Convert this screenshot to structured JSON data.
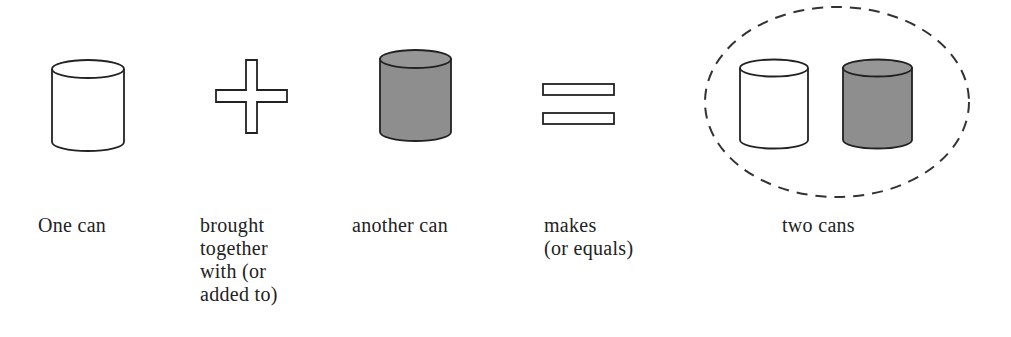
{
  "diagram": {
    "title": "",
    "colors": {
      "stroke": "#222222",
      "can_white": "#ffffff",
      "can_gray": "#8e8e8e",
      "dashed_ellipse": "#333333"
    },
    "items": [
      {
        "id": "one-can",
        "icon": "white-can",
        "label": "One can"
      },
      {
        "id": "plus",
        "icon": "plus-sign",
        "label": "brought\ntogether\nwith (or\nadded to)"
      },
      {
        "id": "another-can",
        "icon": "gray-can",
        "label": "another can"
      },
      {
        "id": "equals",
        "icon": "equals-sign",
        "label": "makes\n(or equals)"
      },
      {
        "id": "two-cans",
        "icon": "dashed-circle-with-white-and-gray-can",
        "label": "two cans"
      }
    ]
  }
}
